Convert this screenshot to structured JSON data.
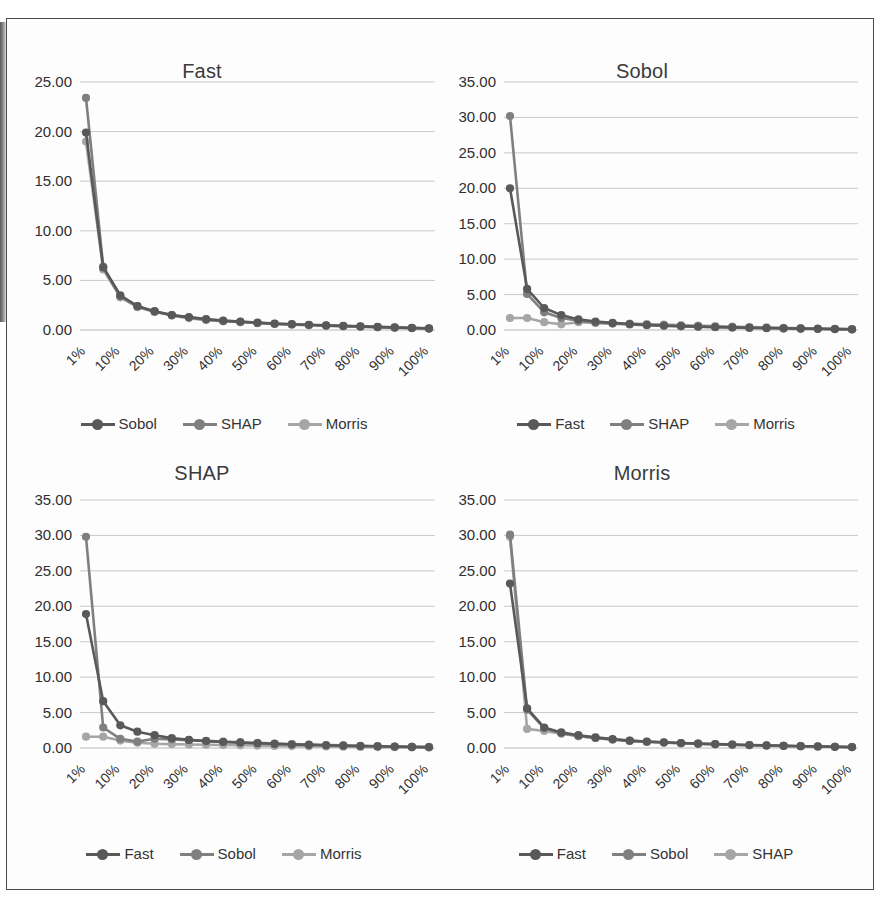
{
  "figure": {
    "background_color": "#ffffff",
    "frame_color": "#4a4a4a",
    "panel_order": [
      "Fast",
      "Sobol",
      "SHAP",
      "Morris"
    ]
  },
  "palette": {
    "series_dark": "#595959",
    "series_mid": "#7f7f7f",
    "series_light": "#a6a6a6",
    "gridline": "#c9c9c9",
    "text": "#3b3b3b"
  },
  "chart_data": [
    {
      "type": "line",
      "title": "Fast",
      "xlabel": "",
      "ylabel": "",
      "grid": true,
      "legend_position": "bottom",
      "ylim": [
        0,
        25
      ],
      "yticks": [
        "0.00",
        "5.00",
        "10.00",
        "15.00",
        "20.00",
        "25.00"
      ],
      "ytick_values": [
        0,
        5,
        10,
        15,
        20,
        25
      ],
      "categories": [
        "1%",
        "5%",
        "10%",
        "15%",
        "20%",
        "25%",
        "30%",
        "35%",
        "40%",
        "45%",
        "50%",
        "55%",
        "60%",
        "65%",
        "70%",
        "75%",
        "80%",
        "85%",
        "90%",
        "95%",
        "100%"
      ],
      "xtick_labels": [
        "1%",
        "10%",
        "20%",
        "30%",
        "40%",
        "50%",
        "60%",
        "70%",
        "80%",
        "90%",
        "100%"
      ],
      "xtick_indices": [
        0,
        2,
        4,
        6,
        8,
        10,
        12,
        14,
        16,
        18,
        20
      ],
      "series": [
        {
          "name": "Sobol",
          "color": "#595959",
          "values": [
            19.9,
            6.3,
            3.5,
            2.4,
            1.9,
            1.5,
            1.3,
            1.1,
            0.95,
            0.85,
            0.75,
            0.65,
            0.58,
            0.52,
            0.46,
            0.41,
            0.36,
            0.31,
            0.26,
            0.21,
            0.16
          ]
        },
        {
          "name": "SHAP",
          "color": "#7f7f7f",
          "values": [
            23.4,
            6.4,
            3.4,
            2.4,
            1.85,
            1.5,
            1.25,
            1.05,
            0.92,
            0.82,
            0.72,
            0.63,
            0.56,
            0.5,
            0.44,
            0.39,
            0.34,
            0.29,
            0.24,
            0.2,
            0.15
          ]
        },
        {
          "name": "Morris",
          "color": "#a6a6a6",
          "values": [
            19.0,
            6.1,
            3.3,
            2.3,
            1.8,
            1.45,
            1.2,
            1.0,
            0.88,
            0.78,
            0.7,
            0.6,
            0.54,
            0.48,
            0.42,
            0.37,
            0.32,
            0.27,
            0.23,
            0.18,
            0.14
          ]
        }
      ]
    },
    {
      "type": "line",
      "title": "Sobol",
      "xlabel": "",
      "ylabel": "",
      "grid": true,
      "legend_position": "bottom",
      "ylim": [
        0,
        35
      ],
      "yticks": [
        "0.00",
        "5.00",
        "10.00",
        "15.00",
        "20.00",
        "25.00",
        "30.00",
        "35.00"
      ],
      "ytick_values": [
        0,
        5,
        10,
        15,
        20,
        25,
        30,
        35
      ],
      "categories": [
        "1%",
        "5%",
        "10%",
        "15%",
        "20%",
        "25%",
        "30%",
        "35%",
        "40%",
        "45%",
        "50%",
        "55%",
        "60%",
        "65%",
        "70%",
        "75%",
        "80%",
        "85%",
        "90%",
        "95%",
        "100%"
      ],
      "xtick_labels": [
        "1%",
        "10%",
        "20%",
        "30%",
        "40%",
        "50%",
        "60%",
        "70%",
        "80%",
        "90%",
        "100%"
      ],
      "xtick_indices": [
        0,
        2,
        4,
        6,
        8,
        10,
        12,
        14,
        16,
        18,
        20
      ],
      "series": [
        {
          "name": "Fast",
          "color": "#595959",
          "values": [
            20.0,
            5.8,
            3.1,
            2.1,
            1.5,
            1.2,
            1.0,
            0.85,
            0.72,
            0.62,
            0.55,
            0.48,
            0.42,
            0.37,
            0.32,
            0.28,
            0.24,
            0.2,
            0.17,
            0.13,
            0.1
          ]
        },
        {
          "name": "SHAP",
          "color": "#7f7f7f",
          "values": [
            30.2,
            5.1,
            2.5,
            1.7,
            1.3,
            1.05,
            0.9,
            0.78,
            0.68,
            0.6,
            0.52,
            0.46,
            0.4,
            0.35,
            0.3,
            0.26,
            0.22,
            0.19,
            0.15,
            0.12,
            0.09
          ]
        },
        {
          "name": "Morris",
          "color": "#a6a6a6",
          "values": [
            1.7,
            1.7,
            1.1,
            0.8,
            1.1,
            1.0,
            0.95,
            0.9,
            0.85,
            0.78,
            0.7,
            0.62,
            0.55,
            0.48,
            0.42,
            0.36,
            0.31,
            0.26,
            0.21,
            0.16,
            0.12
          ]
        }
      ]
    },
    {
      "type": "line",
      "title": "SHAP",
      "xlabel": "",
      "ylabel": "",
      "grid": true,
      "legend_position": "bottom",
      "ylim": [
        0,
        35
      ],
      "yticks": [
        "0.00",
        "5.00",
        "10.00",
        "15.00",
        "20.00",
        "25.00",
        "30.00",
        "35.00"
      ],
      "ytick_values": [
        0,
        5,
        10,
        15,
        20,
        25,
        30,
        35
      ],
      "categories": [
        "1%",
        "5%",
        "10%",
        "15%",
        "20%",
        "25%",
        "30%",
        "35%",
        "40%",
        "45%",
        "50%",
        "55%",
        "60%",
        "65%",
        "70%",
        "75%",
        "80%",
        "85%",
        "90%",
        "95%",
        "100%"
      ],
      "xtick_labels": [
        "1%",
        "10%",
        "20%",
        "30%",
        "40%",
        "50%",
        "60%",
        "70%",
        "80%",
        "90%",
        "100%"
      ],
      "xtick_indices": [
        0,
        2,
        4,
        6,
        8,
        10,
        12,
        14,
        16,
        18,
        20
      ],
      "series": [
        {
          "name": "Fast",
          "color": "#595959",
          "values": [
            18.9,
            6.6,
            3.2,
            2.3,
            1.8,
            1.4,
            1.15,
            0.98,
            0.85,
            0.75,
            0.66,
            0.58,
            0.5,
            0.44,
            0.38,
            0.33,
            0.28,
            0.24,
            0.2,
            0.16,
            0.12
          ]
        },
        {
          "name": "Sobol",
          "color": "#7f7f7f",
          "values": [
            29.8,
            2.9,
            1.3,
            0.9,
            1.3,
            1.2,
            1.1,
            1.0,
            0.9,
            0.82,
            0.72,
            0.64,
            0.56,
            0.49,
            0.42,
            0.36,
            0.31,
            0.26,
            0.21,
            0.17,
            0.13
          ]
        },
        {
          "name": "Morris",
          "color": "#a6a6a6",
          "values": [
            1.6,
            1.6,
            1.05,
            0.75,
            0.6,
            0.55,
            0.5,
            0.46,
            0.42,
            0.38,
            0.34,
            0.3,
            0.27,
            0.24,
            0.21,
            0.18,
            0.15,
            0.13,
            0.11,
            0.09,
            0.07
          ]
        }
      ]
    },
    {
      "type": "line",
      "title": "Morris",
      "xlabel": "",
      "ylabel": "",
      "grid": true,
      "legend_position": "bottom",
      "ylim": [
        0,
        35
      ],
      "yticks": [
        "0.00",
        "5.00",
        "10.00",
        "15.00",
        "20.00",
        "25.00",
        "30.00",
        "35.00"
      ],
      "ytick_values": [
        0,
        5,
        10,
        15,
        20,
        25,
        30,
        35
      ],
      "categories": [
        "1%",
        "5%",
        "10%",
        "15%",
        "20%",
        "25%",
        "30%",
        "35%",
        "40%",
        "45%",
        "50%",
        "55%",
        "60%",
        "65%",
        "70%",
        "75%",
        "80%",
        "85%",
        "90%",
        "95%",
        "100%"
      ],
      "xtick_labels": [
        "1%",
        "10%",
        "20%",
        "30%",
        "40%",
        "50%",
        "60%",
        "70%",
        "80%",
        "90%",
        "100%"
      ],
      "xtick_indices": [
        0,
        2,
        4,
        6,
        8,
        10,
        12,
        14,
        16,
        18,
        20
      ],
      "series": [
        {
          "name": "Fast",
          "color": "#595959",
          "values": [
            23.2,
            5.6,
            2.9,
            2.2,
            1.8,
            1.5,
            1.25,
            1.05,
            0.92,
            0.8,
            0.7,
            0.62,
            0.55,
            0.48,
            0.42,
            0.36,
            0.31,
            0.26,
            0.22,
            0.17,
            0.13
          ]
        },
        {
          "name": "Sobol",
          "color": "#7f7f7f",
          "values": [
            30.1,
            5.4,
            2.8,
            2.1,
            1.7,
            1.42,
            1.2,
            1.0,
            0.88,
            0.77,
            0.68,
            0.6,
            0.53,
            0.46,
            0.4,
            0.35,
            0.3,
            0.25,
            0.21,
            0.17,
            0.13
          ]
        },
        {
          "name": "Morris-alt",
          "display_name": "SHAP",
          "color": "#a6a6a6",
          "values": [
            29.8,
            2.7,
            2.4,
            2.0,
            1.65,
            1.4,
            1.18,
            1.0,
            0.86,
            0.76,
            0.67,
            0.59,
            0.52,
            0.45,
            0.39,
            0.34,
            0.29,
            0.25,
            0.21,
            0.16,
            0.12
          ]
        }
      ]
    }
  ],
  "panels": [
    {
      "title": "Fast",
      "legend": [
        {
          "label": "Sobol",
          "color": "#595959"
        },
        {
          "label": "SHAP",
          "color": "#7f7f7f"
        },
        {
          "label": "Morris",
          "color": "#a6a6a6"
        }
      ]
    },
    {
      "title": "Sobol",
      "legend": [
        {
          "label": "Fast",
          "color": "#595959"
        },
        {
          "label": "SHAP",
          "color": "#7f7f7f"
        },
        {
          "label": "Morris",
          "color": "#a6a6a6"
        }
      ]
    },
    {
      "title": "SHAP",
      "legend": [
        {
          "label": "Fast",
          "color": "#595959"
        },
        {
          "label": "Sobol",
          "color": "#7f7f7f"
        },
        {
          "label": "Morris",
          "color": "#a6a6a6"
        }
      ]
    },
    {
      "title": "Morris",
      "legend": [
        {
          "label": "Fast",
          "color": "#595959"
        },
        {
          "label": "Sobol",
          "color": "#7f7f7f"
        },
        {
          "label": "SHAP",
          "color": "#a6a6a6"
        }
      ]
    }
  ]
}
